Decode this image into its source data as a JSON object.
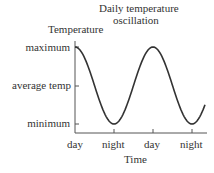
{
  "chart_data": {
    "type": "line",
    "title_lines": [
      "Daily temperature",
      "oscillation"
    ],
    "xlabel": "Time",
    "ylabel": "Temperature",
    "x_ticks": [
      "day",
      "night",
      "day",
      "night"
    ],
    "y_ticks": [
      "maximum",
      "average temp",
      "minimum"
    ],
    "series": [
      {
        "name": "Temperature",
        "shape": "cosine",
        "x": [
          0,
          0.5,
          1,
          1.5,
          2,
          2.5,
          3,
          3.3
        ],
        "values": [
          1,
          0,
          -1,
          0,
          1,
          0,
          -1,
          -0.6
        ]
      }
    ],
    "ylim": [
      -1,
      1
    ],
    "grid": false,
    "legend": "none",
    "line_color": "#333333"
  }
}
